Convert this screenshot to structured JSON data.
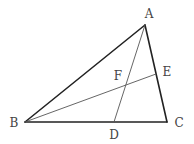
{
  "diagram": {
    "type": "triangle-geometry",
    "points": {
      "A": {
        "label": "A",
        "x": 145,
        "y": 25,
        "lx": 149,
        "ly": 18
      },
      "B": {
        "label": "B",
        "x": 25,
        "y": 122,
        "lx": 14,
        "ly": 127
      },
      "C": {
        "label": "C",
        "x": 167,
        "y": 122,
        "lx": 179,
        "ly": 127
      },
      "D": {
        "label": "D",
        "x": 114,
        "y": 122,
        "lx": 114,
        "ly": 139
      },
      "E": {
        "label": "E",
        "x": 156,
        "y": 74,
        "lx": 167,
        "ly": 76
      },
      "F": {
        "label": "F",
        "x": 126,
        "y": 85,
        "lx": 118,
        "ly": 80
      }
    },
    "segments": [
      {
        "from": "A",
        "to": "B",
        "style": "thick"
      },
      {
        "from": "B",
        "to": "C",
        "style": "thick"
      },
      {
        "from": "C",
        "to": "A",
        "style": "thick"
      },
      {
        "from": "A",
        "to": "D",
        "style": "thin"
      },
      {
        "from": "B",
        "to": "E",
        "style": "thin"
      }
    ],
    "colors": {
      "thick": "#222222",
      "thin": "#555555",
      "label": "#444444"
    }
  }
}
